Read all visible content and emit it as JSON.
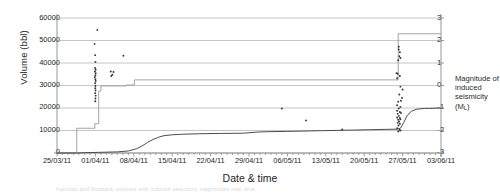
{
  "chart_data": {
    "type": "line",
    "title": "",
    "xlabel": "Date & time",
    "ylabel": "Volume (bbl)",
    "y2label": "Magnitude of induced seismicity (M",
    "y2label_sub": "L",
    "y2label_close": ")",
    "grid": true,
    "legend": "none",
    "xlim": [
      "25/03/11",
      "03/06/11"
    ],
    "ylim": [
      0,
      60000
    ],
    "y2lim": [
      -3,
      3
    ],
    "x_tick_labels": [
      "25/03/11",
      "01/04/11",
      "08/04/11",
      "15/04/11",
      "22/04/11",
      "29/04/11",
      "06/05/11",
      "13/05/11",
      "20/05/11",
      "27/05/11",
      "03/06/11"
    ],
    "x_tick_days": [
      0,
      7,
      14,
      21,
      28,
      35,
      42,
      49,
      56,
      63,
      70
    ],
    "y_tick_labels": [
      "60000",
      "50000",
      "40000",
      "30000",
      "20000",
      "10000",
      "0"
    ],
    "y_tick_values": [
      60000,
      50000,
      40000,
      30000,
      20000,
      10000,
      0
    ],
    "y2_tick_labels": [
      "3",
      "2",
      "1",
      "0",
      "-1",
      "-2",
      "-3"
    ],
    "y2_tick_values": [
      3,
      2,
      1,
      0,
      -1,
      -2,
      -3
    ],
    "series": [
      {
        "name": "Cumulative injected volume (step)",
        "axis": "left",
        "style": "step",
        "color": "#9a9a9a",
        "points": [
          [
            0,
            0
          ],
          [
            3.6,
            0
          ],
          [
            3.6,
            11000
          ],
          [
            6.9,
            11000
          ],
          [
            6.9,
            13000
          ],
          [
            7.6,
            13000
          ],
          [
            7.6,
            27500
          ],
          [
            8.0,
            27500
          ],
          [
            8.0,
            29800
          ],
          [
            12.6,
            29800
          ],
          [
            12.6,
            30200
          ],
          [
            14.1,
            30200
          ],
          [
            14.1,
            32500
          ],
          [
            62.2,
            32500
          ],
          [
            62.2,
            53000
          ],
          [
            70,
            53000
          ]
        ]
      },
      {
        "name": "Cumulative flowback volume (smooth)",
        "axis": "left",
        "style": "line",
        "color": "#4d4d4d",
        "points": [
          [
            0,
            0
          ],
          [
            3.5,
            0
          ],
          [
            5.0,
            150
          ],
          [
            8.0,
            300
          ],
          [
            11.0,
            500
          ],
          [
            13.0,
            900
          ],
          [
            14.5,
            1900
          ],
          [
            15.5,
            3100
          ],
          [
            16.5,
            4700
          ],
          [
            17.5,
            6000
          ],
          [
            18.5,
            7000
          ],
          [
            19.5,
            7700
          ],
          [
            21.0,
            8100
          ],
          [
            23.0,
            8350
          ],
          [
            26.0,
            8550
          ],
          [
            30.0,
            8700
          ],
          [
            34.0,
            8800
          ],
          [
            36.5,
            9300
          ],
          [
            39.0,
            9500
          ],
          [
            42.0,
            9600
          ],
          [
            45.0,
            9750
          ],
          [
            48.0,
            9900
          ],
          [
            51.0,
            10050
          ],
          [
            54.0,
            10200
          ],
          [
            57.0,
            10350
          ],
          [
            60.0,
            10500
          ],
          [
            62.0,
            10600
          ],
          [
            62.6,
            11000
          ],
          [
            63.2,
            13500
          ],
          [
            63.8,
            16500
          ],
          [
            64.6,
            18600
          ],
          [
            65.6,
            19500
          ],
          [
            67.0,
            19800
          ],
          [
            70.0,
            19950
          ]
        ]
      }
    ],
    "scatter": {
      "name": "Induced seismic events",
      "axis": "right",
      "marker": "dot",
      "color": "#333333",
      "points": [
        [
          7.35,
          2.47
        ],
        [
          6.85,
          1.85
        ],
        [
          6.95,
          1.35
        ],
        [
          7.0,
          1.05
        ],
        [
          6.95,
          0.78
        ],
        [
          7.05,
          0.7
        ],
        [
          6.9,
          0.62
        ],
        [
          7.05,
          0.55
        ],
        [
          7.0,
          0.46
        ],
        [
          6.9,
          0.38
        ],
        [
          7.0,
          0.28
        ],
        [
          7.05,
          0.2
        ],
        [
          6.95,
          0.1
        ],
        [
          7.0,
          -0.02
        ],
        [
          6.98,
          -0.12
        ],
        [
          7.02,
          -0.22
        ],
        [
          6.95,
          -0.34
        ],
        [
          7.05,
          -0.45
        ],
        [
          7.0,
          -0.58
        ],
        [
          6.98,
          -0.7
        ],
        [
          9.8,
          0.62
        ],
        [
          10.3,
          0.6
        ],
        [
          10.1,
          0.48
        ],
        [
          9.9,
          0.42
        ],
        [
          12.1,
          1.32
        ],
        [
          41.0,
          -1.02
        ],
        [
          45.4,
          -1.55
        ],
        [
          52.0,
          -1.95
        ],
        [
          62.3,
          1.72
        ],
        [
          62.3,
          1.6
        ],
        [
          62.5,
          1.48
        ],
        [
          62.4,
          1.3
        ],
        [
          62.6,
          1.22
        ],
        [
          62.2,
          1.12
        ],
        [
          61.9,
          0.55
        ],
        [
          62.1,
          0.52
        ],
        [
          62.5,
          0.42
        ],
        [
          62.0,
          0.32
        ],
        [
          62.6,
          -0.05
        ],
        [
          63.0,
          -0.18
        ],
        [
          62.4,
          -0.4
        ],
        [
          62.9,
          -0.55
        ],
        [
          62.2,
          -0.72
        ],
        [
          62.7,
          -0.68
        ],
        [
          62.0,
          -0.88
        ],
        [
          62.6,
          -0.95
        ],
        [
          62.3,
          -1.02
        ],
        [
          62.0,
          -1.12
        ],
        [
          62.5,
          -1.18
        ],
        [
          62.1,
          -1.26
        ],
        [
          62.7,
          -1.22
        ],
        [
          62.3,
          -1.35
        ],
        [
          62.0,
          -1.42
        ],
        [
          62.5,
          -1.44
        ],
        [
          62.2,
          -1.52
        ],
        [
          62.6,
          -1.5
        ],
        [
          62.35,
          -1.6
        ],
        [
          62.1,
          -1.66
        ],
        [
          62.5,
          -1.7
        ],
        [
          62.25,
          -1.78
        ],
        [
          62.0,
          -1.9
        ],
        [
          62.45,
          -1.98
        ],
        [
          62.2,
          -2.04
        ],
        [
          62.6,
          -2.0
        ]
      ]
    },
    "caption_faint": "Injection and flowback volumes with induced seismicity magnitudes over time"
  }
}
